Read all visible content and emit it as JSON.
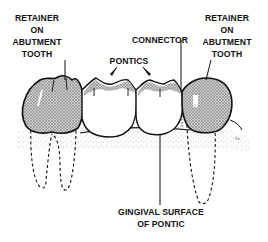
{
  "diagram": {
    "labels": {
      "retainer_left": [
        "RETAINER",
        "ON",
        "ABUTMENT",
        "TOOTH"
      ],
      "retainer_right": [
        "RETAINER",
        "ON",
        "ABUTMENT",
        "TOOTH"
      ],
      "connector": "CONNECTOR",
      "pontics": "PONTICS",
      "gingival_surface": [
        "GINGIVAL SURFACE",
        "OF PONTIC"
      ]
    },
    "colors": {
      "ink": "#111111",
      "background": "#ffffff",
      "stipple": "#888888"
    }
  }
}
